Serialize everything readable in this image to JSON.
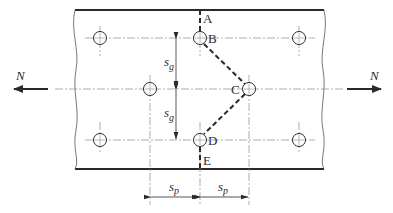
{
  "diagram": {
    "type": "bolted-plate-staggered-holes",
    "colors": {
      "line": "#2a2a2a",
      "centerline": "#8a8a8a",
      "background": "#ffffff"
    },
    "points": [
      {
        "label": "A"
      },
      {
        "label": "B"
      },
      {
        "label": "C"
      },
      {
        "label": "D"
      },
      {
        "label": "E"
      }
    ],
    "forces": {
      "left": "N",
      "right": "N"
    },
    "dimensions": {
      "gauge": {
        "symbol": "s",
        "subscript": "g"
      },
      "pitch": {
        "symbol": "s",
        "subscript": "p"
      }
    }
  }
}
